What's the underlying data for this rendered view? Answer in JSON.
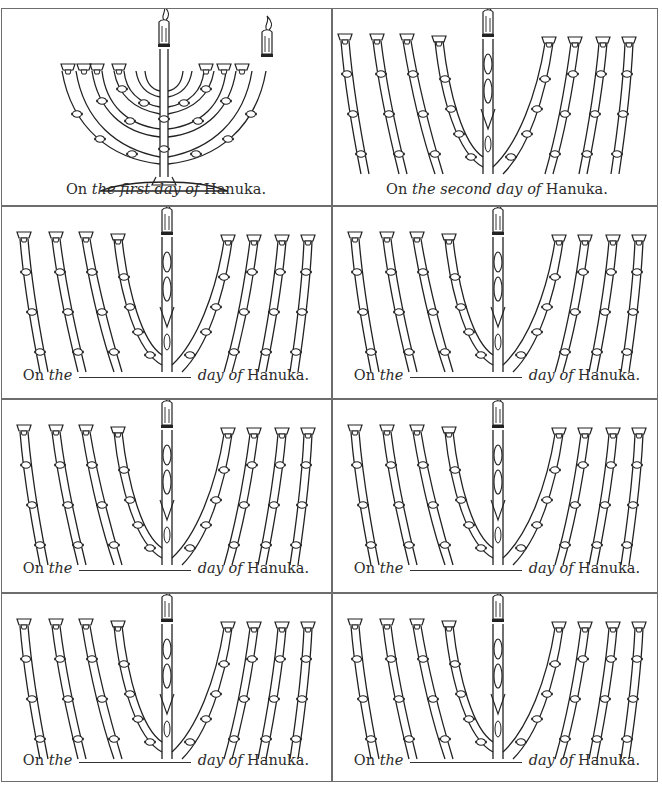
{
  "worksheet": {
    "title": "Hanuka menorah day cards",
    "cells": [
      {
        "id": 1,
        "prefix": "On",
        "italic_mid": "the first day of",
        "suffix": "Hanuka.",
        "has_blank": false,
        "lit_candles": 1,
        "full_menorah": true
      },
      {
        "id": 2,
        "prefix": "On",
        "italic_mid": "the second day of",
        "suffix": "Hanuka.",
        "has_blank": false,
        "lit_candles": 0,
        "full_menorah": false
      },
      {
        "id": 3,
        "prefix": "On",
        "italic_the": "the",
        "italic_after": "day of",
        "suffix": "Hanuka.",
        "has_blank": true
      },
      {
        "id": 4,
        "prefix": "On",
        "italic_the": "the",
        "italic_after": "day of",
        "suffix": "Hanuka.",
        "has_blank": true
      },
      {
        "id": 5,
        "prefix": "On",
        "italic_the": "the",
        "italic_after": "day of",
        "suffix": "Hanuka.",
        "has_blank": true
      },
      {
        "id": 6,
        "prefix": "On",
        "italic_the": "the",
        "italic_after": "day of",
        "suffix": "Hanuka.",
        "has_blank": true
      },
      {
        "id": 7,
        "prefix": "On",
        "italic_the": "the",
        "italic_after": "day of",
        "suffix": "Hanuka.",
        "has_blank": true
      },
      {
        "id": 8,
        "prefix": "On",
        "italic_the": "the",
        "italic_after": "day of",
        "suffix": "Hanuka.",
        "has_blank": true
      }
    ],
    "colors": {
      "line": "#6d6d6d",
      "ink": "#2b2b2b"
    }
  }
}
